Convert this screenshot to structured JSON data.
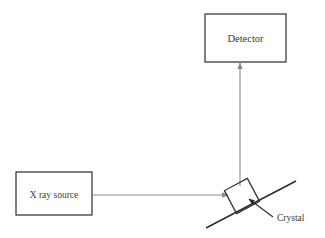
{
  "diagram": {
    "background_color": "#ffffff",
    "line_color_dark": "#2b2b2b",
    "line_color_light": "#8a8a8a",
    "text_color": "#3a3a3a",
    "nodes": {
      "detector": {
        "label": "Detector",
        "x": 205,
        "y": 14,
        "width": 81,
        "height": 48,
        "label_x": 245.5,
        "label_y": 42,
        "font_size": 10.5
      },
      "source": {
        "label": "X ray source",
        "x": 16,
        "y": 172,
        "width": 76,
        "height": 43,
        "label_x": 54,
        "label_y": 198,
        "font_size": 9.5
      },
      "crystal": {
        "label": "Crystal",
        "label_x": 277,
        "label_y": 221,
        "font_size": 9.5,
        "center_x": 242,
        "center_y": 196,
        "size": 26,
        "rotation_deg": -28
      }
    },
    "edges": {
      "incident_beam": {
        "name": "incident beam",
        "x1": 92,
        "y1": 195,
        "x2": 228,
        "y2": 195
      },
      "diffracted_beam": {
        "name": "diffracted beam",
        "x1": 240,
        "y1": 186,
        "x2": 240,
        "y2": 63
      },
      "crystal_plane": {
        "name": "crystal plane line",
        "x1": 206,
        "y1": 228,
        "x2": 296,
        "y2": 181
      },
      "crystal_leader": {
        "name": "crystal label leader",
        "x1": 273,
        "y1": 217,
        "x2": 249,
        "y2": 199
      }
    }
  }
}
